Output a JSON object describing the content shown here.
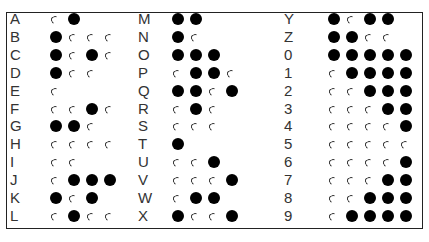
{
  "legend": {
    "dot_symbol": "open-arc",
    "dash_symbol": "filled-circle"
  },
  "columns": [
    {
      "x_label": 10,
      "x_code": 50,
      "rows": [
        {
          "char": "A",
          "code": ".-"
        },
        {
          "char": "B",
          "code": "-..."
        },
        {
          "char": "C",
          "code": "-.-."
        },
        {
          "char": "D",
          "code": "-.."
        },
        {
          "char": "E",
          "code": "."
        },
        {
          "char": "F",
          "code": "..-."
        },
        {
          "char": "G",
          "code": "--."
        },
        {
          "char": "H",
          "code": "...."
        },
        {
          "char": "I",
          "code": ".."
        },
        {
          "char": "J",
          "code": ".---"
        },
        {
          "char": "K",
          "code": "-.-"
        },
        {
          "char": "L",
          "code": ".-.."
        }
      ]
    },
    {
      "x_label": 138,
      "x_code": 172,
      "rows": [
        {
          "char": "M",
          "code": "--"
        },
        {
          "char": "N",
          "code": "-."
        },
        {
          "char": "O",
          "code": "---"
        },
        {
          "char": "P",
          "code": ".--."
        },
        {
          "char": "Q",
          "code": "--.-"
        },
        {
          "char": "R",
          "code": ".-."
        },
        {
          "char": "S",
          "code": "..."
        },
        {
          "char": "T",
          "code": "-"
        },
        {
          "char": "U",
          "code": "..-"
        },
        {
          "char": "V",
          "code": "...-"
        },
        {
          "char": "W",
          "code": ".--"
        },
        {
          "char": "X",
          "code": "-..-"
        }
      ]
    },
    {
      "x_label": 284,
      "x_code": 328,
      "rows": [
        {
          "char": "Y",
          "code": "-.--"
        },
        {
          "char": "Z",
          "code": "--.."
        },
        {
          "char": "0",
          "code": "-----"
        },
        {
          "char": "1",
          "code": ".----"
        },
        {
          "char": "2",
          "code": "..---"
        },
        {
          "char": "3",
          "code": "...--"
        },
        {
          "char": "4",
          "code": "....-"
        },
        {
          "char": "5",
          "code": "....."
        },
        {
          "char": "6",
          "code": "....-"
        },
        {
          "char": "7",
          "code": "...--"
        },
        {
          "char": "8",
          "code": "..---"
        },
        {
          "char": "9",
          "code": ".----"
        }
      ]
    }
  ]
}
